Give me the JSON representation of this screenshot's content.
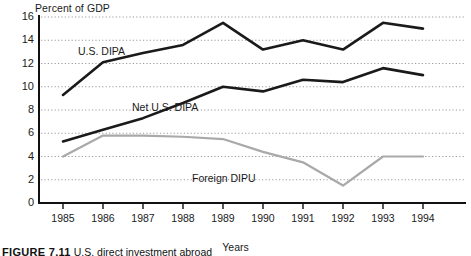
{
  "figure": {
    "caption_number": "FIGURE 7.11",
    "caption_text": "U.S. direct investment abroad"
  },
  "chart_data": {
    "type": "line",
    "title": "",
    "xlabel": "Years",
    "ylabel": "Percent of GDP",
    "ylim": [
      0,
      16
    ],
    "xlim": [
      "1985",
      "1994"
    ],
    "grid": true,
    "grid_axis": "y",
    "legend_position": "inline-labels",
    "categories": [
      "1985",
      "1986",
      "1987",
      "1988",
      "1989",
      "1990",
      "1991",
      "1992",
      "1993",
      "1994"
    ],
    "yticks": [
      0,
      2,
      4,
      6,
      8,
      10,
      12,
      14,
      16
    ],
    "series": [
      {
        "name": "U.S. DIPA",
        "color": "#1a1a1a",
        "values": [
          9.3,
          12.1,
          12.9,
          13.6,
          15.5,
          13.2,
          14.0,
          13.2,
          15.5,
          15.0
        ]
      },
      {
        "name": "Net U.S. DIPA",
        "color": "#1a1a1a",
        "values": [
          5.3,
          6.3,
          7.3,
          8.6,
          10.0,
          9.6,
          10.6,
          10.4,
          11.6,
          11.0
        ]
      },
      {
        "name": "Foreign DIPU",
        "color": "#a9a9a9",
        "values": [
          4.0,
          5.8,
          5.8,
          5.7,
          5.5,
          4.4,
          3.5,
          1.5,
          4.0,
          4.0
        ]
      }
    ]
  },
  "axes": {
    "y_title": "Percent of GDP",
    "x_title": "Years",
    "y_tick_labels": [
      "16",
      "14",
      "12",
      "10",
      "8",
      "6",
      "4",
      "2",
      "0"
    ],
    "x_tick_labels": [
      "1985",
      "1986",
      "1987",
      "1988",
      "1989",
      "1990",
      "1991",
      "1992",
      "1993",
      "1994"
    ]
  },
  "series_labels": {
    "us_dipa": "U.S. DIPA",
    "net_us_dipa": "Net U.S. DIPA",
    "foreign_dipu": "Foreign DIPU"
  },
  "colors": {
    "dark_line": "#1a1a1a",
    "light_line": "#a9a9a9",
    "grid": "#9a9a9a",
    "axis": "#111111",
    "background": "#ffffff"
  }
}
